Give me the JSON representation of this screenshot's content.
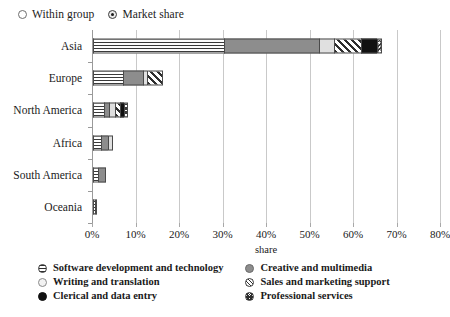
{
  "controls": {
    "options": [
      {
        "label": "Within group",
        "selected": false,
        "name": "radio-within-group"
      },
      {
        "label": "Market share",
        "selected": true,
        "name": "radio-market-share"
      }
    ]
  },
  "chart_data": {
    "type": "bar",
    "orientation": "horizontal",
    "stacked": true,
    "title": "",
    "xlabel": "share",
    "ylabel": "",
    "xlim": [
      0,
      80
    ],
    "xtick_labels": [
      "0%",
      "10%",
      "20%",
      "30%",
      "40%",
      "50%",
      "60%",
      "70%",
      "80%"
    ],
    "xticks": [
      0,
      10,
      20,
      30,
      40,
      50,
      60,
      70,
      80
    ],
    "grid": true,
    "legend_position": "bottom",
    "categories": [
      "Asia",
      "Europe",
      "North America",
      "Africa",
      "South America",
      "Oceania"
    ],
    "series": [
      {
        "name": "Software development and technology",
        "pattern": "horizontal-lines",
        "color": "#ffffff",
        "values": [
          30.0,
          6.8,
          2.6,
          1.9,
          1.2,
          0.5
        ]
      },
      {
        "name": "Creative and multimedia",
        "pattern": "solid-gray",
        "color": "#8d8d8d",
        "values": [
          22.0,
          4.7,
          1.1,
          1.5,
          1.7,
          0.3
        ]
      },
      {
        "name": "Writing and translation",
        "pattern": "solid-light",
        "color": "#e0e0e0",
        "values": [
          3.4,
          1.0,
          1.3,
          1.3,
          0.0,
          0.0
        ]
      },
      {
        "name": "Sales and marketing support",
        "pattern": "diagonal-hatch",
        "color": "#ffffff",
        "values": [
          6.2,
          3.5,
          1.2,
          0.0,
          0.0,
          0.0
        ]
      },
      {
        "name": "Clerical and data entry",
        "pattern": "solid-black",
        "color": "#111111",
        "values": [
          3.6,
          0.0,
          0.9,
          0.0,
          0.0,
          0.0
        ]
      },
      {
        "name": "Professional services",
        "pattern": "cross-hatch",
        "color": "#ffffff",
        "values": [
          1.3,
          0.0,
          0.9,
          0.0,
          0.0,
          0.0
        ]
      }
    ],
    "totals": [
      66.5,
      16.0,
      8.0,
      4.7,
      2.9,
      0.8
    ]
  },
  "legend": {
    "left_column": [
      {
        "label": "Software development and technology",
        "swatch": "software-swatch"
      },
      {
        "label": "Writing and translation",
        "swatch": "writing-swatch"
      },
      {
        "label": "Clerical and data entry",
        "swatch": "clerical-swatch"
      }
    ],
    "right_column": [
      {
        "label": "Creative and multimedia",
        "swatch": "creative-swatch"
      },
      {
        "label": "Sales and marketing support",
        "swatch": "sales-swatch"
      },
      {
        "label": "Professional services",
        "swatch": "professional-swatch"
      }
    ]
  }
}
